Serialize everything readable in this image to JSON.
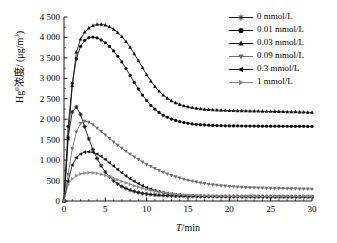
{
  "chart_data": {
    "type": "line",
    "title": "",
    "xlabel": "T/min",
    "ylabel": "Hg0 浓度/(μg/m3)",
    "ylabel_main": "Hg",
    "ylabel_sup": "0",
    "ylabel_rest": "浓度/ (μg/m",
    "ylabel_sup2": "3",
    "ylabel_end": ")",
    "xlim": [
      0,
      30
    ],
    "ylim": [
      0,
      4500
    ],
    "xticks": [
      0,
      5,
      10,
      15,
      20,
      25,
      30
    ],
    "xtick_labels": [
      "0",
      "5",
      "10",
      "15",
      "20",
      "25",
      "30"
    ],
    "yticks": [
      0,
      500,
      1000,
      1500,
      2000,
      2500,
      3000,
      3500,
      4000,
      4500
    ],
    "ytick_labels": [
      "0",
      "500",
      "1 000",
      "1 500",
      "2 000",
      "2 500",
      "3 000",
      "3 500",
      "4 000",
      "4 500"
    ],
    "grid": false,
    "legend_position": "top-right",
    "x": [
      0,
      0.5,
      1,
      1.5,
      2,
      2.5,
      3,
      3.5,
      4,
      4.5,
      5,
      5.5,
      6,
      6.5,
      7,
      7.5,
      8,
      8.5,
      9,
      9.5,
      10,
      10.5,
      11,
      11.5,
      12,
      12.5,
      13,
      13.5,
      14,
      14.5,
      15,
      15.5,
      16,
      16.5,
      17,
      17.5,
      18,
      18.5,
      19,
      19.5,
      20,
      20.5,
      21,
      21.5,
      22,
      22.5,
      23,
      23.5,
      24,
      24.5,
      25,
      25.5,
      26,
      26.5,
      27,
      27.5,
      28,
      28.5,
      29,
      29.5,
      30
    ],
    "series": [
      {
        "name": "0 mmol/L",
        "marker": "star",
        "color": "#141414",
        "values": [
          0,
          1560,
          2180,
          2300,
          2120,
          1820,
          1520,
          1260,
          1040,
          860,
          710,
          590,
          495,
          418,
          356,
          306,
          266,
          234,
          208,
          188,
          172,
          159,
          149,
          141,
          135,
          130,
          126,
          123,
          120,
          118,
          116,
          115,
          114,
          113,
          112,
          111,
          111,
          110,
          110,
          109,
          109,
          109,
          108,
          108,
          108,
          108,
          107,
          107,
          107,
          107,
          107,
          106,
          106,
          106,
          106,
          106,
          106,
          105,
          105,
          105,
          105
        ]
      },
      {
        "name": "0.01 mmol/L",
        "marker": "circle",
        "color": "#0d0d0d",
        "values": [
          0,
          1820,
          2880,
          3480,
          3780,
          3930,
          3995,
          4010,
          3990,
          3940,
          3870,
          3780,
          3670,
          3540,
          3400,
          3240,
          3070,
          2900,
          2740,
          2590,
          2455,
          2340,
          2245,
          2165,
          2100,
          2048,
          2005,
          1970,
          1942,
          1919,
          1900,
          1886,
          1875,
          1866,
          1859,
          1853,
          1848,
          1844,
          1841,
          1839,
          1837,
          1836,
          1835,
          1834,
          1833,
          1832,
          1832,
          1831,
          1831,
          1830,
          1830,
          1829,
          1829,
          1828,
          1828,
          1827,
          1827,
          1826,
          1826,
          1825,
          1825
        ]
      },
      {
        "name": "0.03 mmol/L",
        "marker": "triangle-up",
        "color": "#111111",
        "values": [
          0,
          1520,
          2820,
          3640,
          3960,
          4130,
          4230,
          4290,
          4320,
          4320,
          4300,
          4260,
          4200,
          4120,
          4020,
          3900,
          3760,
          3600,
          3430,
          3260,
          3090,
          2935,
          2800,
          2685,
          2590,
          2512,
          2450,
          2400,
          2360,
          2328,
          2302,
          2282,
          2266,
          2253,
          2243,
          2235,
          2228,
          2223,
          2219,
          2215,
          2212,
          2209,
          2207,
          2205,
          2203,
          2201,
          2199,
          2197,
          2195,
          2193,
          2191,
          2189,
          2187,
          2185,
          2182,
          2180,
          2177,
          2174,
          2171,
          2168,
          2165
        ]
      },
      {
        "name": "0.09 mmol/L",
        "marker": "triangle-down",
        "color": "#6e6e6e",
        "values": [
          0,
          660,
          1280,
          1690,
          1900,
          1955,
          1930,
          1865,
          1785,
          1700,
          1615,
          1530,
          1448,
          1368,
          1292,
          1218,
          1148,
          1080,
          1016,
          956,
          898,
          845,
          795,
          748,
          705,
          665,
          628,
          594,
          563,
          535,
          509,
          486,
          465,
          446,
          429,
          414,
          400,
          388,
          377,
          368,
          359,
          352,
          345,
          339,
          334,
          329,
          325,
          321,
          318,
          315,
          312,
          310,
          308,
          306,
          304,
          302,
          300,
          298,
          296,
          294,
          292
        ]
      },
      {
        "name": "0.3 mmol/L",
        "marker": "triangle-left",
        "color": "#101010",
        "values": [
          0,
          480,
          880,
          1060,
          1150,
          1195,
          1205,
          1190,
          1150,
          1090,
          1018,
          938,
          855,
          772,
          692,
          616,
          546,
          482,
          425,
          374,
          330,
          292,
          259,
          231,
          208,
          188,
          172,
          159,
          148,
          139,
          132,
          126,
          122,
          118,
          115,
          113,
          111,
          109,
          108,
          107,
          106,
          105,
          104,
          104,
          103,
          103,
          102,
          102,
          101,
          101,
          101,
          100,
          100,
          100,
          99,
          99,
          99,
          98,
          98,
          98,
          98
        ]
      },
      {
        "name": "1 mmol/L",
        "marker": "triangle-right",
        "color": "#8a8a8a",
        "values": [
          0,
          395,
          545,
          620,
          662,
          684,
          693,
          690,
          676,
          654,
          626,
          594,
          558,
          520,
          482,
          444,
          407,
          372,
          339,
          309,
          282,
          258,
          236,
          217,
          201,
          187,
          175,
          165,
          157,
          150,
          144,
          139,
          135,
          132,
          129,
          127,
          125,
          123,
          122,
          121,
          120,
          119,
          118,
          118,
          117,
          117,
          116,
          116,
          116,
          115,
          115,
          115,
          115,
          114,
          114,
          114,
          114,
          113,
          113,
          113,
          113
        ]
      }
    ]
  },
  "legend": {
    "items": [
      {
        "label": "0 mmol/L"
      },
      {
        "label": "0.01 mmol/L"
      },
      {
        "label": "0.03 mmol/L"
      },
      {
        "label": "0.09 mmol/L"
      },
      {
        "label": "0.3 mmol/L"
      },
      {
        "label": "1 mmol/L"
      }
    ]
  },
  "axis": {
    "x_title_italic": "T",
    "x_title_rest": "/min"
  }
}
